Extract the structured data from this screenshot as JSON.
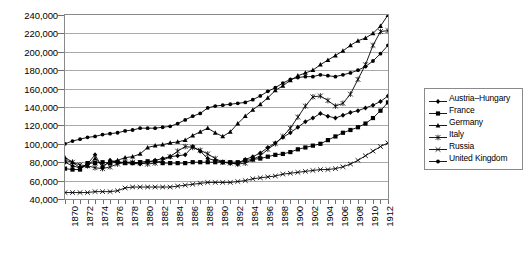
{
  "chart_data": {
    "type": "line",
    "title": "",
    "subtitle": "",
    "xlabel": "",
    "ylabel": "",
    "grid": true,
    "legend_position": "right",
    "xlim": [
      1870,
      1913
    ],
    "ylim": [
      40000,
      240000
    ],
    "y_ticks": [
      "40,000",
      "60,000",
      "80,000",
      "100,000",
      "120,000",
      "140,000",
      "160,000",
      "180,000",
      "200,000",
      "220,000",
      "240,000"
    ],
    "y_tick_values": [
      40000,
      60000,
      80000,
      100000,
      120000,
      140000,
      160000,
      180000,
      200000,
      220000,
      240000
    ],
    "x_tick_labels": [
      "1870",
      "1872",
      "1874",
      "1876",
      "1878",
      "1880",
      "1882",
      "1884",
      "1886",
      "1888",
      "1890",
      "1892",
      "1894",
      "1896",
      "1898",
      "1900",
      "1902",
      "1904",
      "1906",
      "1908",
      "1910",
      "1912"
    ],
    "x": [
      1870,
      1871,
      1872,
      1873,
      1874,
      1875,
      1876,
      1877,
      1878,
      1879,
      1880,
      1881,
      1882,
      1883,
      1884,
      1885,
      1886,
      1887,
      1888,
      1889,
      1890,
      1891,
      1892,
      1893,
      1894,
      1895,
      1896,
      1897,
      1898,
      1899,
      1900,
      1901,
      1902,
      1903,
      1904,
      1905,
      1906,
      1907,
      1908,
      1909,
      1910,
      1911,
      1912,
      1913
    ],
    "series": [
      {
        "name": "Austria–Hungary",
        "marker": "diamond",
        "values": [
          80000,
          76000,
          74000,
          78000,
          88000,
          74000,
          82000,
          80000,
          80000,
          79000,
          78000,
          80000,
          82000,
          84000,
          86000,
          87000,
          88000,
          97000,
          92000,
          84000,
          82000,
          80000,
          79000,
          78000,
          83000,
          86000,
          90000,
          96000,
          101000,
          107000,
          112000,
          118000,
          124000,
          128000,
          133000,
          130000,
          128000,
          131000,
          134000,
          136000,
          139000,
          142000,
          146000,
          152000
        ]
      },
      {
        "name": "France",
        "marker": "square",
        "values": [
          73000,
          72000,
          72000,
          79000,
          79000,
          80000,
          79000,
          80000,
          79000,
          79000,
          80000,
          81000,
          81000,
          79000,
          79000,
          79000,
          79000,
          80000,
          80000,
          80000,
          80000,
          80000,
          80000,
          80000,
          82000,
          83000,
          84000,
          86000,
          88000,
          89000,
          91000,
          94000,
          96000,
          98000,
          100000,
          104000,
          108000,
          112000,
          115000,
          118000,
          122000,
          128000,
          136000,
          145000
        ]
      },
      {
        "name": "Germany",
        "marker": "triangle",
        "values": [
          85000,
          80000,
          74000,
          76000,
          84000,
          76000,
          80000,
          82000,
          85000,
          86000,
          89000,
          96000,
          98000,
          99000,
          101000,
          102000,
          104000,
          109000,
          113000,
          117000,
          112000,
          108000,
          113000,
          122000,
          130000,
          137000,
          143000,
          150000,
          158000,
          163000,
          169000,
          174000,
          177000,
          180000,
          186000,
          191000,
          196000,
          201000,
          207000,
          212000,
          215000,
          220000,
          228000,
          240000
        ]
      },
      {
        "name": "Italy",
        "marker": "star",
        "values": [
          82000,
          80000,
          77000,
          76000,
          74000,
          73000,
          75000,
          78000,
          80000,
          80000,
          79000,
          78000,
          79000,
          82000,
          86000,
          92000,
          97000,
          96000,
          93000,
          89000,
          84000,
          80000,
          79000,
          78000,
          79000,
          83000,
          87000,
          94000,
          100000,
          108000,
          117000,
          129000,
          141000,
          151000,
          152000,
          147000,
          141000,
          144000,
          154000,
          170000,
          186000,
          207000,
          222000,
          223000
        ]
      },
      {
        "name": "Russia",
        "marker": "dash",
        "values": [
          47000,
          47000,
          47000,
          47000,
          48000,
          48000,
          48000,
          49000,
          52000,
          53000,
          53000,
          53000,
          53000,
          53000,
          53000,
          54000,
          55000,
          56000,
          57000,
          58000,
          58000,
          58000,
          58000,
          59000,
          60000,
          62000,
          63000,
          64000,
          65000,
          67000,
          68000,
          69000,
          70000,
          71000,
          72000,
          72000,
          73000,
          75000,
          78000,
          82000,
          87000,
          92000,
          97000,
          101000
        ]
      },
      {
        "name": "United Kingdom",
        "marker": "circle",
        "values": [
          100000,
          103000,
          105000,
          107000,
          108000,
          110000,
          111000,
          112000,
          114000,
          115000,
          117000,
          117000,
          117000,
          118000,
          119000,
          122000,
          126000,
          130000,
          133000,
          139000,
          141000,
          142000,
          143000,
          144000,
          145000,
          148000,
          152000,
          157000,
          161000,
          166000,
          170000,
          172000,
          173000,
          173000,
          175000,
          174000,
          173000,
          175000,
          177000,
          180000,
          184000,
          190000,
          198000,
          207000
        ]
      }
    ]
  },
  "legend": {
    "items": [
      {
        "label": "Austria–Hungary"
      },
      {
        "label": "France"
      },
      {
        "label": "Germany"
      },
      {
        "label": "Italy"
      },
      {
        "label": "Russia"
      },
      {
        "label": "United Kingdom"
      }
    ]
  },
  "colors": {
    "series": "#000000",
    "grid": "#a9a9a9",
    "frame": "#8a8a8a",
    "background": "#ffffff"
  }
}
